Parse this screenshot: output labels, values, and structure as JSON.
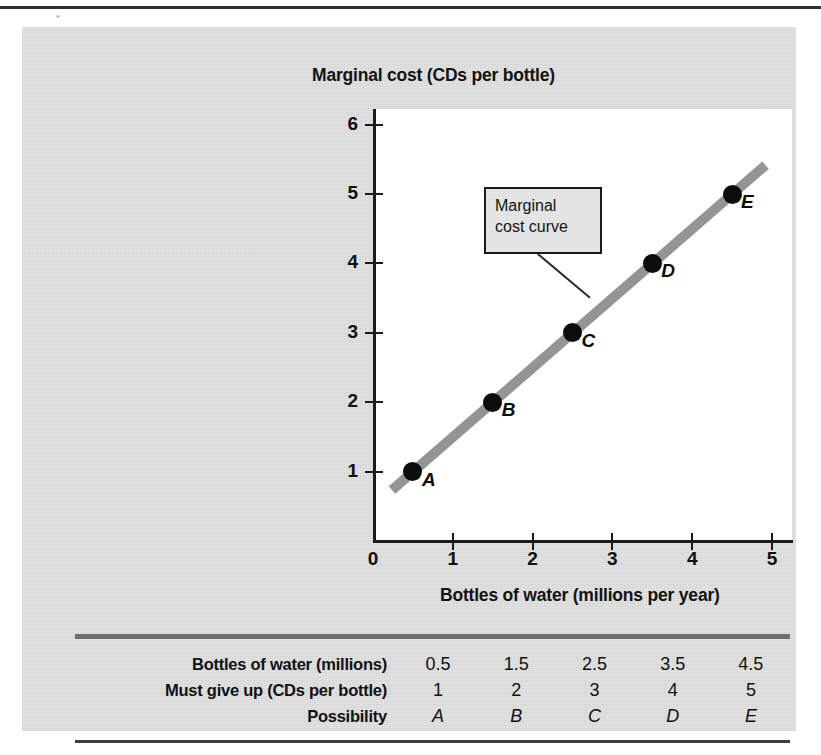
{
  "figure": {
    "chart_title": "Marginal cost (CDs per bottle)",
    "x_axis_title": "Bottles of water (millions per year)",
    "annotation": {
      "line1": "Marginal",
      "line2": "cost curve"
    }
  },
  "colors": {
    "panel_background": "#e2e2e2",
    "plot_background": "#ffffff",
    "curve": "#949494",
    "marker": "#0c0c0c",
    "axis": "#1b1b1b",
    "rule_thick": "#6f6f6f",
    "rule_thin": "#3f3f3f",
    "callout_background": "#e6e6e6"
  },
  "chart_data": {
    "type": "line",
    "title": "Marginal cost (CDs per bottle)",
    "subtitle": "",
    "xlabel": "Bottles of water (millions per year)",
    "ylabel": "Marginal cost (CDs per bottle)",
    "xlim": [
      0,
      5.4
    ],
    "ylim": [
      0,
      6.2
    ],
    "xticks": [
      "0",
      "1",
      "2",
      "3",
      "4",
      "5"
    ],
    "yticks": [
      "6",
      "5",
      "4",
      "3",
      "2",
      "1"
    ],
    "grid": false,
    "legend": "none",
    "annotations": [
      {
        "text": "Marginal cost curve",
        "points_to": "curve near point C"
      }
    ],
    "series": [
      {
        "name": "Marginal cost curve",
        "x": [
          0.5,
          1.5,
          2.5,
          3.5,
          4.5
        ],
        "values": [
          1,
          2,
          3,
          4,
          5
        ],
        "point_labels": [
          "A",
          "B",
          "C",
          "D",
          "E"
        ]
      }
    ]
  },
  "points": [
    {
      "label": "A",
      "x": 0.5,
      "y": 1
    },
    {
      "label": "B",
      "x": 1.5,
      "y": 2
    },
    {
      "label": "C",
      "x": 2.5,
      "y": 3
    },
    {
      "label": "D",
      "x": 3.5,
      "y": 4
    },
    {
      "label": "E",
      "x": 4.5,
      "y": 5
    }
  ],
  "axis": {
    "y_ticks": [
      "6",
      "5",
      "4",
      "3",
      "2",
      "1"
    ],
    "x_ticks": [
      "0",
      "1",
      "2",
      "3",
      "4",
      "5"
    ]
  },
  "table": {
    "rows": [
      {
        "label": "Bottles of water (millions)",
        "values": [
          "0.5",
          "1.5",
          "2.5",
          "3.5",
          "4.5"
        ],
        "italic": false
      },
      {
        "label": "Must give up (CDs per bottle)",
        "values": [
          "1",
          "2",
          "3",
          "4",
          "5"
        ],
        "italic": false
      },
      {
        "label": "Possibility",
        "values": [
          "A",
          "B",
          "C",
          "D",
          "E"
        ],
        "italic": true
      }
    ]
  }
}
